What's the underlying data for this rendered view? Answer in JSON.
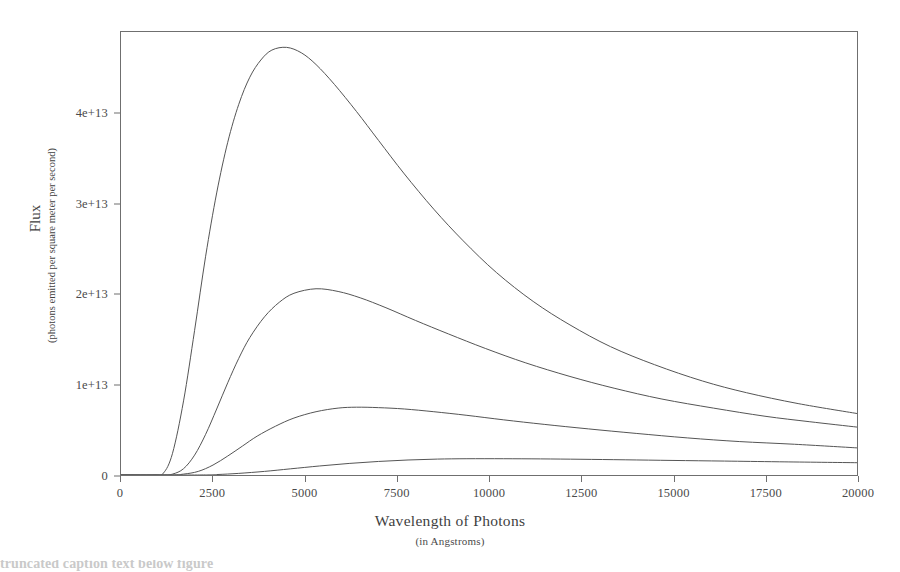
{
  "chart_data": {
    "type": "line",
    "title": "",
    "xlabel": "Wavelength of Photons",
    "xlabel_sub": "(in Angstroms)",
    "ylabel": "Flux",
    "ylabel_sub": "(photons emitted per square meter per second)",
    "xlim": [
      0,
      20000
    ],
    "ylim": [
      0,
      49000000000000.0
    ],
    "grid": false,
    "legend": "none",
    "xticks": [
      0,
      2500,
      5000,
      7500,
      10000,
      12500,
      15000,
      17500,
      20000
    ],
    "xtick_labels": [
      "0",
      "2500",
      "5000",
      "7500",
      "10000",
      "12500",
      "15000",
      "17500",
      "20000"
    ],
    "yticks": [
      0,
      10000000000000,
      20000000000000,
      30000000000000,
      40000000000000
    ],
    "ytick_labels": [
      "0",
      "1e+13",
      "2e+13",
      "3e+13",
      "4e+13"
    ],
    "series": [
      {
        "name": "curve-1",
        "peak_x": 4500,
        "peak_y": 47300000000000,
        "points": [
          [
            0,
            0
          ],
          [
            900,
            0
          ],
          [
            1150,
            200000000000
          ],
          [
            1400,
            2400000000000
          ],
          [
            1700,
            8200000000000
          ],
          [
            2000,
            16000000000000
          ],
          [
            2300,
            24200000000000
          ],
          [
            2600,
            31200000000000
          ],
          [
            2900,
            36800000000000
          ],
          [
            3200,
            41000000000000
          ],
          [
            3500,
            44000000000000
          ],
          [
            3800,
            45900000000000
          ],
          [
            4100,
            47000000000000
          ],
          [
            4500,
            47300000000000
          ],
          [
            4900,
            46700000000000
          ],
          [
            5300,
            45400000000000
          ],
          [
            5800,
            43200000000000
          ],
          [
            6400,
            40200000000000
          ],
          [
            7000,
            37000000000000
          ],
          [
            7700,
            33300000000000
          ],
          [
            8500,
            29400000000000
          ],
          [
            9300,
            25900000000000
          ],
          [
            10200,
            22400000000000
          ],
          [
            11200,
            19200000000000
          ],
          [
            12200,
            16600000000000
          ],
          [
            13300,
            14200000000000
          ],
          [
            14500,
            12200000000000
          ],
          [
            15800,
            10400000000000
          ],
          [
            17000,
            9100000000000
          ],
          [
            18400,
            7900000000000
          ],
          [
            20000,
            6800000000000
          ]
        ]
      },
      {
        "name": "curve-2",
        "peak_x": 5300,
        "peak_y": 20600000000000,
        "points": [
          [
            0,
            0
          ],
          [
            1100,
            0
          ],
          [
            1400,
            100000000000
          ],
          [
            1700,
            700000000000
          ],
          [
            2000,
            2200000000000
          ],
          [
            2300,
            4500000000000
          ],
          [
            2600,
            7300000000000
          ],
          [
            2900,
            10200000000000
          ],
          [
            3200,
            12900000000000
          ],
          [
            3500,
            15200000000000
          ],
          [
            3900,
            17500000000000
          ],
          [
            4300,
            19100000000000
          ],
          [
            4700,
            20100000000000
          ],
          [
            5300,
            20600000000000
          ],
          [
            5900,
            20300000000000
          ],
          [
            6500,
            19600000000000
          ],
          [
            7200,
            18500000000000
          ],
          [
            8000,
            17100000000000
          ],
          [
            8900,
            15600000000000
          ],
          [
            9900,
            14000000000000
          ],
          [
            11000,
            12400000000000
          ],
          [
            12200,
            10900000000000
          ],
          [
            13400,
            9600000000000
          ],
          [
            14700,
            8400000000000
          ],
          [
            16100,
            7400000000000
          ],
          [
            17500,
            6500000000000
          ],
          [
            18700,
            5900000000000
          ],
          [
            20000,
            5300000000000
          ]
        ]
      },
      {
        "name": "curve-3",
        "peak_x": 6400,
        "peak_y": 7500000000000,
        "points": [
          [
            0,
            0
          ],
          [
            1300,
            0
          ],
          [
            1700,
            100000000000
          ],
          [
            2100,
            400000000000
          ],
          [
            2500,
            1100000000000
          ],
          [
            2900,
            2100000000000
          ],
          [
            3300,
            3200000000000
          ],
          [
            3700,
            4300000000000
          ],
          [
            4200,
            5400000000000
          ],
          [
            4700,
            6300000000000
          ],
          [
            5300,
            7000000000000
          ],
          [
            5900,
            7400000000000
          ],
          [
            6400,
            7500000000000
          ],
          [
            7000,
            7450000000000
          ],
          [
            7700,
            7300000000000
          ],
          [
            8500,
            7000000000000
          ],
          [
            9400,
            6600000000000
          ],
          [
            10400,
            6100000000000
          ],
          [
            11500,
            5600000000000
          ],
          [
            12700,
            5100000000000
          ],
          [
            14000,
            4600000000000
          ],
          [
            15400,
            4100000000000
          ],
          [
            16800,
            3700000000000
          ],
          [
            18300,
            3400000000000
          ],
          [
            20000,
            3000000000000
          ]
        ]
      },
      {
        "name": "curve-4",
        "peak_x": 9000,
        "peak_y": 1800000000000,
        "points": [
          [
            0,
            0
          ],
          [
            2000,
            0
          ],
          [
            2600,
            50000000000
          ],
          [
            3200,
            180000000000
          ],
          [
            3900,
            400000000000
          ],
          [
            4600,
            680000000000
          ],
          [
            5400,
            1000000000000
          ],
          [
            6200,
            1280000000000
          ],
          [
            7000,
            1500000000000
          ],
          [
            7800,
            1660000000000
          ],
          [
            8600,
            1760000000000
          ],
          [
            9400,
            1800000000000
          ],
          [
            10400,
            1800000000000
          ],
          [
            11400,
            1780000000000
          ],
          [
            12500,
            1740000000000
          ],
          [
            13700,
            1680000000000
          ],
          [
            15000,
            1610000000000
          ],
          [
            16400,
            1540000000000
          ],
          [
            17900,
            1460000000000
          ],
          [
            20000,
            1360000000000
          ]
        ]
      }
    ],
    "colors": {
      "curve": "#555555",
      "axis": "#6f6f6f",
      "text": "#3f3f3f",
      "background": "#ffffff"
    }
  },
  "caption": {
    "text": "truncated caption text below figure"
  }
}
